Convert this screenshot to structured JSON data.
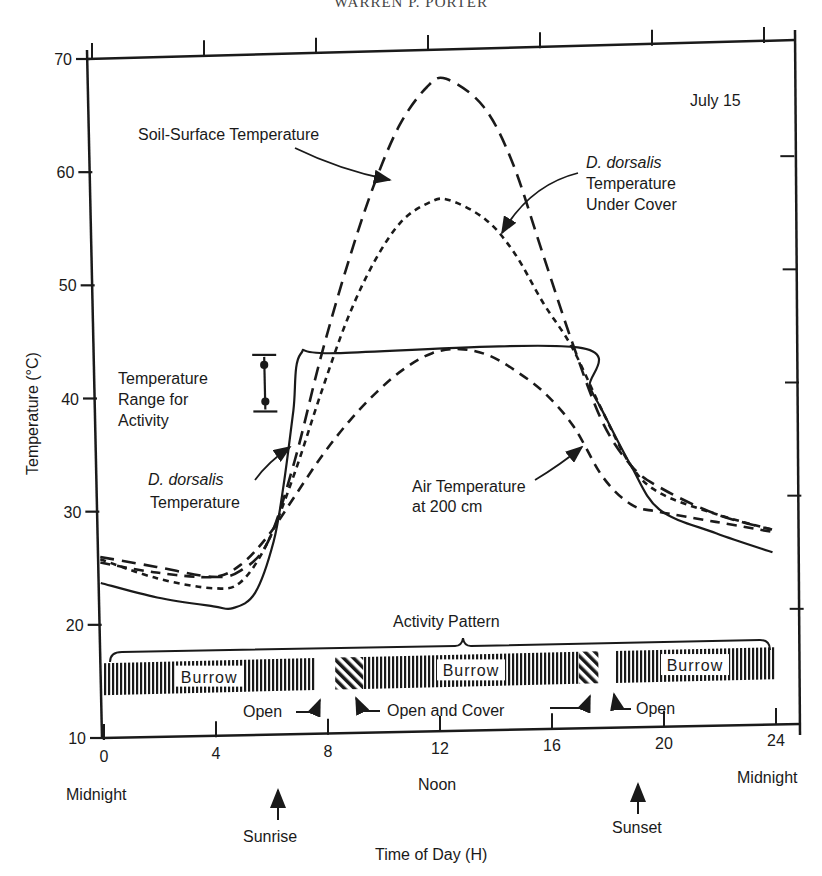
{
  "header": {
    "running_head": "WARREN P. PORTER"
  },
  "chart_data": {
    "type": "line",
    "title": "",
    "date_label": "July 15",
    "xlabel": "Time of Day (H)",
    "ylabel": "Temperature (°C)",
    "xlim": [
      0,
      24
    ],
    "ylim": [
      10,
      70
    ],
    "xticks": [
      0,
      4,
      8,
      12,
      16,
      20,
      24
    ],
    "yticks": [
      10,
      20,
      30,
      40,
      50,
      60,
      70
    ],
    "x_annotations": [
      {
        "x": 0,
        "label": "Midnight"
      },
      {
        "x": 12,
        "label": "Noon"
      },
      {
        "x": 24,
        "label": "Midnight"
      },
      {
        "x": 6.2,
        "label": "Sunrise"
      },
      {
        "x": 19.2,
        "label": "Sunset"
      }
    ],
    "grid": false,
    "series": [
      {
        "name": "Soil-Surface Temperature",
        "style": "long-dash",
        "x": [
          0,
          2,
          4,
          5,
          6,
          7,
          8,
          9,
          10,
          11,
          12,
          12.7,
          14,
          15,
          16,
          17,
          18,
          19,
          20,
          22,
          24
        ],
        "y": [
          26,
          25,
          24,
          24.5,
          27,
          34,
          43,
          51,
          58,
          63.5,
          66.8,
          67.5,
          65,
          60,
          52,
          44,
          37,
          33,
          31,
          28.5,
          27
        ]
      },
      {
        "name": "D. dorsalis Temperature Under Cover",
        "style": "short-dash",
        "x": [
          0,
          2,
          4,
          5,
          6,
          7,
          8,
          9,
          10,
          11,
          12,
          12.7,
          14,
          15,
          16,
          17,
          18,
          19,
          20,
          22,
          24
        ],
        "y": [
          25.8,
          24,
          23,
          23.5,
          27,
          33,
          40,
          46.5,
          51.5,
          55,
          56.6,
          56.8,
          55,
          52,
          47.5,
          43.5,
          38,
          33,
          30.5,
          28.5,
          27
        ]
      },
      {
        "name": "D. dorsalis Temperature",
        "style": "solid",
        "x": [
          0,
          2,
          4,
          4.7,
          5.5,
          6.2,
          6.6,
          7.0,
          7.3,
          8.6,
          17.2,
          17.6,
          18.0,
          19,
          20,
          22,
          24
        ],
        "y": [
          23.7,
          22.3,
          21.4,
          21.2,
          22.5,
          27,
          32,
          38.5,
          43.5,
          43.5,
          43.5,
          40,
          38,
          33,
          29,
          26.8,
          25
        ]
      },
      {
        "name": "Air Temperature at 200 cm",
        "style": "dash",
        "x": [
          0,
          2,
          4,
          5,
          6,
          7,
          8,
          9,
          10,
          11,
          12,
          13,
          14,
          15,
          16,
          17,
          18,
          19,
          20,
          22,
          24
        ],
        "y": [
          25.5,
          24.5,
          24,
          25,
          27.5,
          31,
          34.5,
          37.5,
          40,
          42,
          43.3,
          43.6,
          43,
          41.5,
          39.5,
          36.5,
          32,
          29.5,
          28.8,
          27.8,
          26.8
        ]
      }
    ],
    "activity_range": {
      "label": "Temperature Range for Activity",
      "min": 38.5,
      "max": 43.5,
      "x": 6.0
    },
    "activity_pattern": {
      "label": "Activity Pattern",
      "segments": [
        {
          "start": 0,
          "end": 7.6,
          "state": "Burrow"
        },
        {
          "start": 7.6,
          "end": 8.3,
          "state": "Open"
        },
        {
          "start": 8.3,
          "end": 9.3,
          "state": "Open and Cover"
        },
        {
          "start": 9.3,
          "end": 17.0,
          "state": "Burrow"
        },
        {
          "start": 17.0,
          "end": 17.7,
          "state": "Open and Cover"
        },
        {
          "start": 17.7,
          "end": 18.3,
          "state": "Open"
        },
        {
          "start": 18.3,
          "end": 24,
          "state": "Burrow"
        }
      ],
      "callouts": [
        "Open",
        "Open and Cover",
        "Open"
      ]
    },
    "annotations": [
      "Soil-Surface Temperature",
      "D. dorsalis Temperature Under Cover",
      "Temperature Range for Activity",
      "D. dorsalis Temperature",
      "Air Temperature at 200 cm"
    ]
  },
  "labels": {
    "date": "July 15",
    "soil": "Soil-Surface Temperature",
    "cover_italic": "D. dorsalis",
    "cover_l2": "Temperature",
    "cover_l3": "Under Cover",
    "range_l1": "Temperature",
    "range_l2": "Range for",
    "range_l3": "Activity",
    "dd_italic": "D. dorsalis",
    "dd_l2": "Temperature",
    "air_l1": "Air Temperature",
    "air_l2": "at 200 cm",
    "activity": "Activity Pattern",
    "burrow": "Burrow",
    "open": "Open",
    "open_cover": "Open and Cover",
    "midnight": "Midnight",
    "noon": "Noon",
    "sunrise": "Sunrise",
    "sunset": "Sunset",
    "xlabel": "Time of Day (H)",
    "ylabel": "Temperature (°C)"
  }
}
